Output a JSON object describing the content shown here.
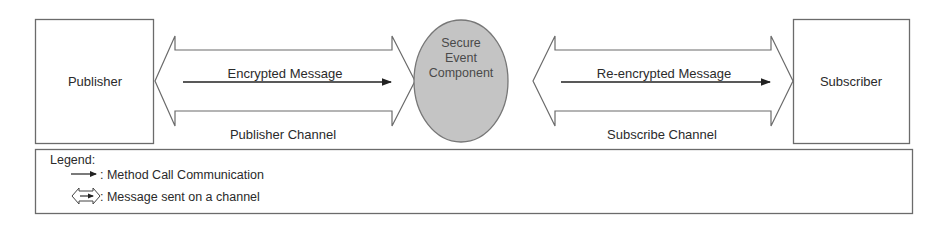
{
  "diagram": {
    "nodes": {
      "publisher": {
        "label": "Publisher"
      },
      "secure_event_component": {
        "lines": [
          "Secure",
          "Event",
          "Component"
        ],
        "fill": "#c4c4c4"
      },
      "subscriber": {
        "label": "Subscriber"
      }
    },
    "channels": {
      "publisher_channel": {
        "label": "Publisher Channel",
        "message": "Encrypted Message"
      },
      "subscribe_channel": {
        "label": "Subscribe Channel",
        "message": "Re-encrypted Message"
      }
    },
    "legend": {
      "title": "Legend:",
      "items": [
        {
          "symbol": "arrow-icon",
          "text": ": Method Call Communication"
        },
        {
          "symbol": "double-arrow-channel-icon",
          "text": ": Message sent on a channel"
        }
      ]
    },
    "colors": {
      "stroke": "#6b6b6b",
      "arrow": "#222222",
      "ellipse_fill": "#c4c4c4",
      "background": "#ffffff"
    }
  }
}
